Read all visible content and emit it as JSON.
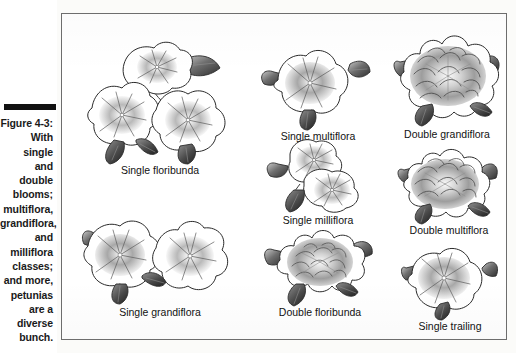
{
  "figure": {
    "label": "Figure 4-3:",
    "caption_lines": [
      "With single",
      "and double",
      "blooms;",
      "multiflora,",
      "grandiflora,",
      "and",
      "milliflora",
      "classes;",
      "and more,",
      "petunias",
      "are a",
      "diverse",
      "bunch."
    ],
    "caption_full": "Figure 4-3: With single and double blooms; multiflora, grandiflora, and milliflora classes; and more, petunias are a diverse bunch."
  },
  "specimens": [
    {
      "id": "single-floribunda",
      "label": "Single floribunda",
      "type": "single",
      "form": "floribunda",
      "column": 1,
      "row": 1
    },
    {
      "id": "single-grandiflora",
      "label": "Single grandiflora",
      "type": "single",
      "form": "grandiflora",
      "column": 1,
      "row": 2
    },
    {
      "id": "single-multiflora",
      "label": "Single multiflora",
      "type": "single",
      "form": "multiflora",
      "column": 2,
      "row": 1
    },
    {
      "id": "single-milliflora",
      "label": "Single milliflora",
      "type": "single",
      "form": "milliflora",
      "column": 2,
      "row": 2
    },
    {
      "id": "double-floribunda",
      "label": "Double floribunda",
      "type": "double",
      "form": "floribunda",
      "column": 2,
      "row": 3
    },
    {
      "id": "double-grandiflora",
      "label": "Double grandiflora",
      "type": "double",
      "form": "grandiflora",
      "column": 3,
      "row": 1
    },
    {
      "id": "double-multiflora",
      "label": "Double multiflora",
      "type": "double",
      "form": "multiflora",
      "column": 3,
      "row": 2
    },
    {
      "id": "single-trailing",
      "label": "Single trailing",
      "type": "single",
      "form": "trailing",
      "column": 3,
      "row": 3
    }
  ],
  "colors": {
    "page_background": "#fbfbf9",
    "figure_background": "#ffffff",
    "frame_border": "#6d6d6d",
    "caption_rule": "#111111",
    "text": "#1a1a1a",
    "petal_outline": "#2a2a2a",
    "leaf_dark": "#3a3a3a",
    "throat_shadow": "#9a9a9a"
  }
}
